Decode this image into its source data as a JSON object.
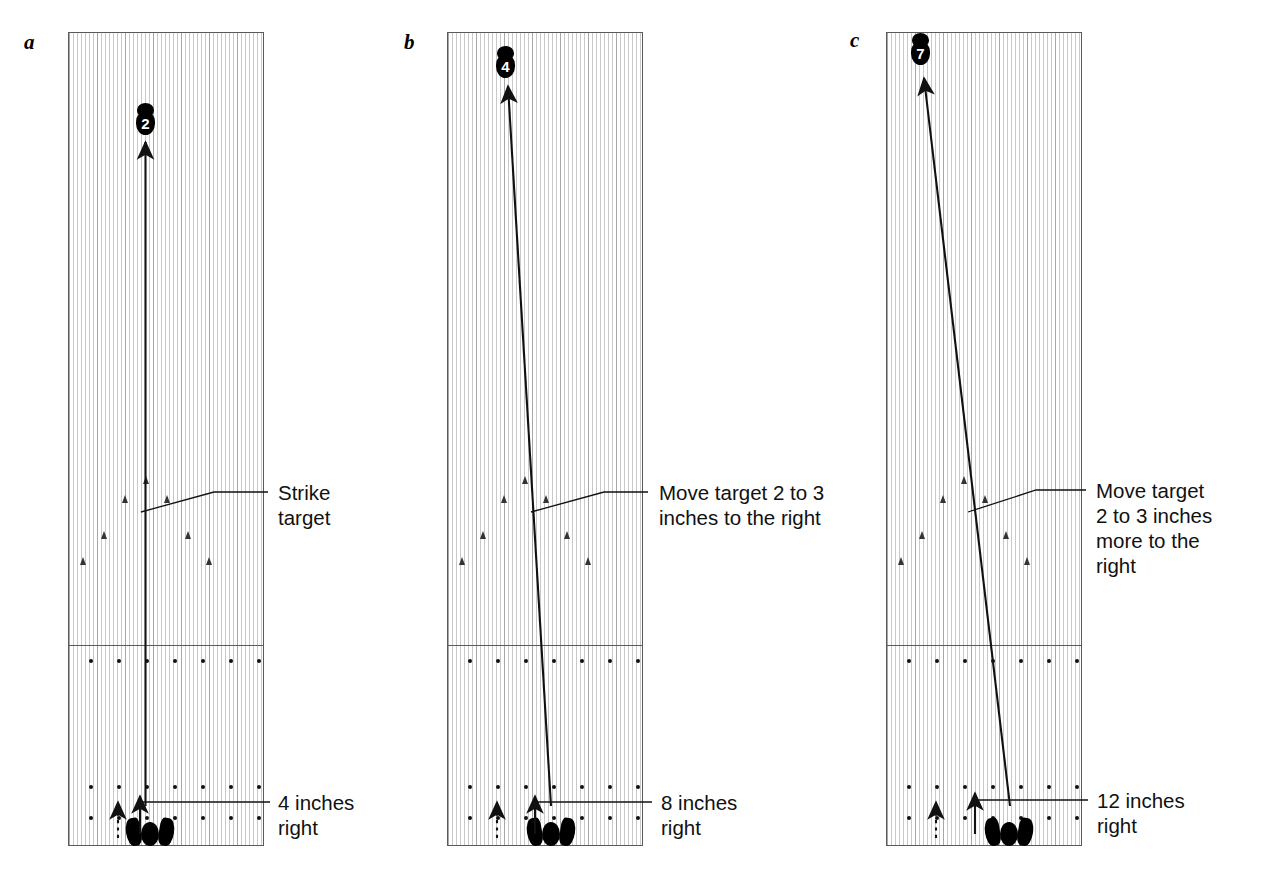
{
  "figure": {
    "ink_color": "#111111",
    "lane_outline_color": "#5a5a5a"
  },
  "panels": [
    {
      "letter": "a",
      "target_pin_label": "2",
      "target_callout": "Strike\ntarget",
      "stance_callout": "4 inches\nright",
      "ball_path": "straight up the center",
      "approach_dots_rows": 3,
      "approach_dots_per_row": 7
    },
    {
      "letter": "b",
      "target_pin_label": "4",
      "target_callout": "Move target 2 to 3\ninches to the right",
      "stance_callout": "8 inches\nright",
      "ball_path": "angled left from right-of-center stance",
      "approach_dots_rows": 3,
      "approach_dots_per_row": 7
    },
    {
      "letter": "c",
      "target_pin_label": "7",
      "target_callout": "Move target\n2 to 3 inches\nmore to the\nright",
      "stance_callout": "12 inches\nright",
      "ball_path": "steeply angled left from far-right stance",
      "approach_dots_rows": 3,
      "approach_dots_per_row": 7
    }
  ],
  "chart_data": {
    "type": "diagram",
    "panels": [
      {
        "panel": "a",
        "target_board": 2,
        "stance_shift_inches": 4,
        "target_shift_note": "Strike target"
      },
      {
        "panel": "b",
        "target_board": 4,
        "stance_shift_inches": 8,
        "target_shift_note": "Move target 2 to 3 inches to the right"
      },
      {
        "panel": "c",
        "target_board": 7,
        "stance_shift_inches": 12,
        "target_shift_note": "Move target 2 to 3 inches more to the right"
      }
    ],
    "xlabel": "",
    "ylabel": "",
    "grid": false,
    "legend": "none"
  }
}
